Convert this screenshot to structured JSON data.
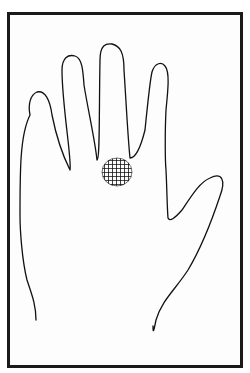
{
  "figure": {
    "frame_color": "#1a1a1a",
    "line_color": "#111111",
    "background_color": "#ffffff",
    "mark": {
      "shape": "cross-hatched-circle",
      "center_x": 117,
      "center_y": 172,
      "radius_x": 15,
      "radius_y": 14,
      "color": "#111111"
    },
    "parts": {
      "fingers": [
        "little-finger",
        "ring-finger",
        "middle-finger",
        "index-finger"
      ],
      "thumb": "thumb",
      "palm": "palm",
      "wrist": "wrist"
    }
  }
}
